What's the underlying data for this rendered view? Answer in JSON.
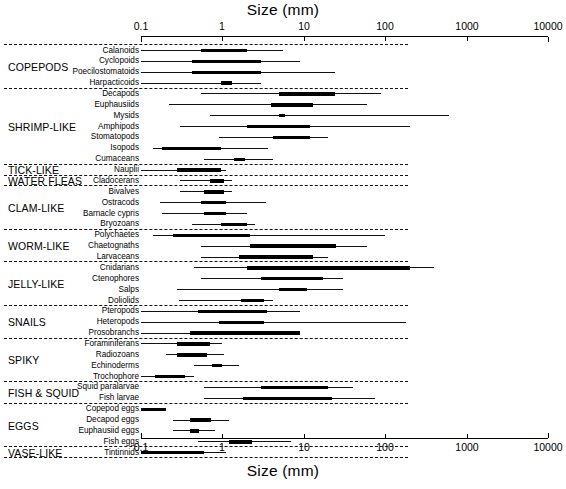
{
  "chart": {
    "title_top": "Size (mm)",
    "title_bottom": "Size (mm)",
    "xlabel": "Size (mm)"
  },
  "axis": {
    "ticks": [
      "0.1",
      "1",
      "10",
      "100",
      "1000",
      "10000"
    ]
  },
  "groups": [
    {
      "label": "COPEPODS"
    },
    {
      "label": "SHRIMP-LIKE"
    },
    {
      "label": "TICK-LIKE"
    },
    {
      "label": "WATER FLEAS"
    },
    {
      "label": "CLAM-LIKE"
    },
    {
      "label": "WORM-LIKE"
    },
    {
      "label": "JELLY-LIKE"
    },
    {
      "label": "SNAILS"
    },
    {
      "label": "SPIKY"
    },
    {
      "label": "FISH & SQUID"
    },
    {
      "label": "EGGS"
    },
    {
      "label": "VASE-LIKE"
    }
  ],
  "taxa": [
    {
      "label": "Calanoids"
    },
    {
      "label": "Cyclopoids"
    },
    {
      "label": "Poecilostomatoids"
    },
    {
      "label": "Harpacticoids"
    },
    {
      "label": "Decapods"
    },
    {
      "label": "Euphausiids"
    },
    {
      "label": "Mysids"
    },
    {
      "label": "Amphipods"
    },
    {
      "label": "Stomatopods"
    },
    {
      "label": "Isopods"
    },
    {
      "label": "Cumaceans"
    },
    {
      "label": "Nauplii"
    },
    {
      "label": "Cladocerans"
    },
    {
      "label": "Bivalves"
    },
    {
      "label": "Ostracods"
    },
    {
      "label": "Barnacle cypris"
    },
    {
      "label": "Bryozoans"
    },
    {
      "label": "Polychaetes"
    },
    {
      "label": "Chaetognaths"
    },
    {
      "label": "Larvaceans"
    },
    {
      "label": "Cnidarians"
    },
    {
      "label": "Ctenophores"
    },
    {
      "label": "Salps"
    },
    {
      "label": "Doliolids"
    },
    {
      "label": "Pteropods"
    },
    {
      "label": "Heteropods"
    },
    {
      "label": "Prosobranchs"
    },
    {
      "label": "Foraminiferans"
    },
    {
      "label": "Radiozoans"
    },
    {
      "label": "Echinoderms"
    },
    {
      "label": "Trochophore"
    },
    {
      "label": "Squid paralarvae"
    },
    {
      "label": "Fish  larvae"
    },
    {
      "label": "Copepod eggs"
    },
    {
      "label": "Decapod eggs"
    },
    {
      "label": "Euphausiid eggs"
    },
    {
      "label": "Fish eggs"
    },
    {
      "label": "Tintinnids"
    }
  ],
  "chart_data": {
    "type": "bar",
    "subtype": "range-bar",
    "title": "Size (mm)",
    "xlabel": "Size (mm)",
    "ylabel": "",
    "xscale": "log",
    "xlim": [
      0.1,
      10000
    ],
    "xticks": [
      0.1,
      1,
      10,
      100,
      1000,
      10000
    ],
    "grid": false,
    "legend": "none",
    "note": "Each row shows total size range (thin line) and typical/common size range (thick bar), in mm.",
    "categories": [
      "Calanoids",
      "Cyclopoids",
      "Poecilostomatoids",
      "Harpacticoids",
      "Decapods",
      "Euphausiids",
      "Mysids",
      "Amphipods",
      "Stomatopods",
      "Isopods",
      "Cumaceans",
      "Nauplii",
      "Cladocerans",
      "Bivalves",
      "Ostracods",
      "Barnacle cypris",
      "Bryozoans",
      "Polychaetes",
      "Chaetognaths",
      "Larvaceans",
      "Cnidarians",
      "Ctenophores",
      "Salps",
      "Doliolids",
      "Pteropods",
      "Heteropods",
      "Prosobranchs",
      "Foraminiferans",
      "Radiozoans",
      "Echinoderms",
      "Trochophore",
      "Squid paralarvae",
      "Fish  larvae",
      "Copepod eggs",
      "Decapod eggs",
      "Euphausiid eggs",
      "Fish eggs",
      "Tintinnids"
    ],
    "group_for_category": [
      "COPEPODS",
      "COPEPODS",
      "COPEPODS",
      "COPEPODS",
      "SHRIMP-LIKE",
      "SHRIMP-LIKE",
      "SHRIMP-LIKE",
      "SHRIMP-LIKE",
      "SHRIMP-LIKE",
      "SHRIMP-LIKE",
      "SHRIMP-LIKE",
      "TICK-LIKE",
      "WATER FLEAS",
      "CLAM-LIKE",
      "CLAM-LIKE",
      "CLAM-LIKE",
      "CLAM-LIKE",
      "WORM-LIKE",
      "WORM-LIKE",
      "WORM-LIKE",
      "JELLY-LIKE",
      "JELLY-LIKE",
      "JELLY-LIKE",
      "JELLY-LIKE",
      "SNAILS",
      "SNAILS",
      "SNAILS",
      "SPIKY",
      "SPIKY",
      "SPIKY",
      "SPIKY",
      "FISH & SQUID",
      "FISH & SQUID",
      "EGGS",
      "EGGS",
      "EGGS",
      "EGGS",
      "VASE-LIKE"
    ],
    "series": [
      {
        "name": "total size range (thin line)",
        "style": "thin",
        "ranges": [
          [
            0.1,
            5.5
          ],
          [
            0.1,
            9.0
          ],
          [
            0.1,
            24.0
          ],
          [
            0.1,
            3.0
          ],
          [
            0.55,
            90.0
          ],
          [
            0.22,
            60.0
          ],
          [
            0.7,
            600.0
          ],
          [
            0.3,
            200.0
          ],
          [
            0.9,
            20.0
          ],
          [
            0.14,
            3.6
          ],
          [
            0.6,
            4.2
          ],
          [
            0.1,
            1.1
          ],
          [
            0.3,
            1.3
          ],
          [
            0.3,
            1.3
          ],
          [
            0.17,
            3.4
          ],
          [
            0.18,
            2.0
          ],
          [
            0.42,
            2.5
          ],
          [
            0.14,
            100.0
          ],
          [
            0.55,
            60.0
          ],
          [
            0.55,
            20.0
          ],
          [
            0.45,
            400.0
          ],
          [
            0.55,
            30.0
          ],
          [
            0.28,
            30.0
          ],
          [
            0.29,
            4.2
          ],
          [
            0.1,
            9.0
          ],
          [
            0.1,
            180.0
          ],
          [
            0.1,
            4.0
          ],
          [
            0.1,
            1.0
          ],
          [
            0.2,
            1.05
          ],
          [
            0.45,
            1.6
          ],
          [
            0.1,
            0.45
          ],
          [
            0.6,
            40.0
          ],
          [
            0.6,
            75.0
          ],
          [
            0.1,
            0.2
          ],
          [
            0.25,
            1.2
          ],
          [
            0.25,
            0.8
          ],
          [
            0.5,
            7.0
          ],
          [
            0.1,
            1.1
          ]
        ]
      },
      {
        "name": "common size range (thick bar)",
        "style": "thick",
        "ranges": [
          [
            0.55,
            2.0
          ],
          [
            0.42,
            3.0
          ],
          [
            0.42,
            3.0
          ],
          [
            0.95,
            1.3
          ],
          [
            5.0,
            24.0
          ],
          [
            4.0,
            13.0
          ],
          [
            5.0,
            5.8
          ],
          [
            2.0,
            12.0
          ],
          [
            4.2,
            12.0
          ],
          [
            0.18,
            0.95
          ],
          [
            1.4,
            1.9
          ],
          [
            0.28,
            0.95
          ],
          [
            0.7,
            1.05
          ],
          [
            0.6,
            1.05
          ],
          [
            0.55,
            1.1
          ],
          [
            0.6,
            1.1
          ],
          [
            0.95,
            2.0
          ],
          [
            0.25,
            2.2
          ],
          [
            2.2,
            25.0
          ],
          [
            1.6,
            13.0
          ],
          [
            2.0,
            200.0
          ],
          [
            3.0,
            17.0
          ],
          [
            5.0,
            11.0
          ],
          [
            1.7,
            3.2
          ],
          [
            0.5,
            3.5
          ],
          [
            0.9,
            3.2
          ],
          [
            0.4,
            9.0
          ],
          [
            0.28,
            0.7
          ],
          [
            0.28,
            0.65
          ],
          [
            0.75,
            1.0
          ],
          [
            0.15,
            0.35
          ],
          [
            3.0,
            20.0
          ],
          [
            1.8,
            22.0
          ],
          [
            0.1,
            0.2
          ],
          [
            0.4,
            0.72
          ],
          [
            0.4,
            0.52
          ],
          [
            1.2,
            2.3
          ],
          [
            0.1,
            0.6
          ]
        ]
      }
    ]
  }
}
